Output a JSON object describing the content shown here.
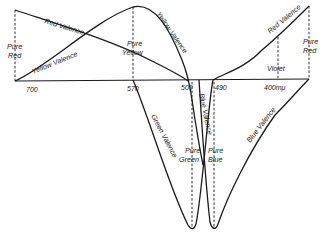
{
  "figure": {
    "axis": {
      "ticks": [
        "700",
        "570",
        "500",
        "490",
        "400mμ"
      ]
    },
    "curves": {
      "red_left": "Red Valence",
      "yellow_left": "Yellow Valence",
      "yellow_right": "Yellow Valence",
      "green": "Green Valence",
      "blue_mid": "Blue Valence",
      "blue_right": "Blue Valence",
      "red_right": "Red Valence"
    },
    "markers": {
      "pure_red_left": [
        "Pure",
        "Red"
      ],
      "pure_yellow": [
        "Pure",
        "Yellow"
      ],
      "pure_green": [
        "Pure",
        "Green"
      ],
      "pure_blue": [
        "Pure",
        "Blue"
      ],
      "violet": "Violet",
      "pure_red_right": [
        "Pure",
        "Red"
      ]
    }
  }
}
